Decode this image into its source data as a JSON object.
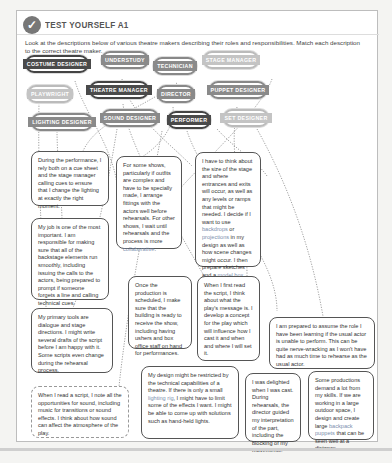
{
  "header": {
    "icon": "check-icon",
    "title": "TEST YOURSELF A1"
  },
  "instructions": "Look at the descriptions below of various theatre makers describing their roles and responsibilities. Match each description to the correct theatre maker.",
  "roles": [
    {
      "id": "costume-designer",
      "label": "COSTUME DESIGNER"
    },
    {
      "id": "understudy",
      "label": "UNDERSTUDY"
    },
    {
      "id": "technician",
      "label": "TECHNICIAN"
    },
    {
      "id": "stage-manager",
      "label": "STAGE MANAGER"
    },
    {
      "id": "playwright",
      "label": "PLAYWRIGHT"
    },
    {
      "id": "theatre-manager",
      "label": "THEATRE MANAGER"
    },
    {
      "id": "director",
      "label": "DIRECTOR"
    },
    {
      "id": "puppet-designer",
      "label": "PUPPET DESIGNER"
    },
    {
      "id": "lighting-designer",
      "label": "LIGHTING DESIGNER"
    },
    {
      "id": "sound-designer",
      "label": "SOUND DESIGNER"
    },
    {
      "id": "performer",
      "label": "PERFORMER"
    },
    {
      "id": "set-designer",
      "label": "SET DESIGNER"
    }
  ],
  "descriptions": [
    {
      "id": "d1",
      "text": "During the performance, I rely both on a cue sheet and the stage manager calling cues to ensure that I change the lighting at exactly the right moment."
    },
    {
      "id": "d2",
      "pre": "For some shows, particularly if outfits are complex and have to be specially made, I arrange fittings with the actors well before rehearsals. For other shows, I wait until rehearsals and the process is more ",
      "highlight": "collaborative",
      "post": "."
    },
    {
      "id": "d3",
      "pre": "I have to think about the size of the stage and where entrances and exits will occur, as well as any levels or ramps that might be needed. I decide if I want to use ",
      "highlight": "backdrops",
      "mid": " or ",
      "highlight2": "projections",
      "mid2": " in my design as well as how scene changes might occur. I then prepare sketches and a ",
      "highlight3": "model box",
      "post": "."
    },
    {
      "id": "d4",
      "text": "My job is one of the most important. I am responsible for making sure that all of the backstage elements run smoothly, including issuing the calls to the actors, being prepared to prompt if someone forgets a line and calling technical cues."
    },
    {
      "id": "d5",
      "text": "Once the production is scheduled, I make sure that the building is ready to receive the show, including having ushers and box office staff on hand for performances."
    },
    {
      "id": "d6",
      "text": "When I first read the script, I think about what the play's message is. I develop a concept for the play which will influence how I cast it and when and where I will set it."
    },
    {
      "id": "d7",
      "text": "I am prepared to assume the role I have been learning if the usual actor is unable to perform. This can be quite nerve-wracking as I won't have had as much time to rehearse as the usual actor."
    },
    {
      "id": "d8",
      "text": "My primary tools are dialogue and stage directions. I might write several drafts of the script before I am happy with it. Some scripts even change during the rehearsal process."
    },
    {
      "id": "d9",
      "pre": "My design might be restricted by the technical capabilities of a theatre. If there is only a small ",
      "highlight": "lighting rig",
      "post": ", I might have to limit some of the effects I want. I might be able to come up with solutions such as hand-held lights."
    },
    {
      "id": "d10",
      "text": "I was delighted when I was cast. During rehearsals, the director guided my interpretation of the part, including the blocking of my movements."
    },
    {
      "id": "d11",
      "pre": "Some productions demand a lot from my skills. If we are working in a large outdoor space, I design and create large ",
      "highlight": "backpack puppets",
      "post": " that can be seen well at a distance."
    },
    {
      "id": "d12",
      "text": "When I read a script, I note all the opportunities for sound, including music for transitions or sound effects. I think about how sound can affect the atmosphere of the play."
    }
  ],
  "colors": {
    "pill_dark": "#4a4a4a",
    "pill_mid": "#8a8a8a",
    "pill_light": "#c4c4c4",
    "highlight": "#7c8fae"
  }
}
